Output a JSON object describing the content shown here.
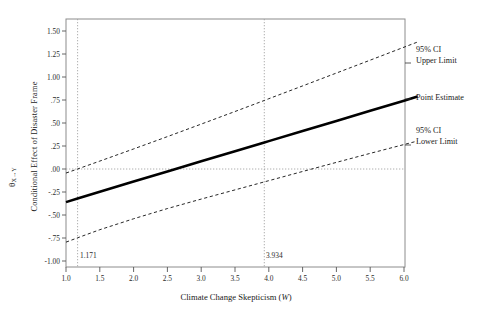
{
  "chart_data": {
    "type": "line",
    "title": "",
    "xlabel": "Climate Change Skepticism (W)",
    "ylabel_symbol": "θ",
    "ylabel_subscript": "X→Y",
    "ylabel_text": "Conditional Effect of Disaster Frame",
    "xlim": [
      1.0,
      6.2
    ],
    "ylim": [
      -1.09,
      1.64
    ],
    "grid": false,
    "legend_position": "right-outside",
    "xticks": [
      1.0,
      1.5,
      2.0,
      2.5,
      3.0,
      3.5,
      4.0,
      4.5,
      5.0,
      5.5,
      6.0
    ],
    "xtick_labels": [
      "1.0",
      "1.5",
      "2.0",
      "2.5",
      "3.0",
      "3.5",
      "4.0",
      "4.5",
      "5.0",
      "5.5",
      "6.0"
    ],
    "yticks": [
      1.5,
      1.25,
      1.0,
      0.75,
      0.5,
      0.25,
      0.0,
      -0.25,
      -0.5,
      -0.75,
      -1.0
    ],
    "ytick_labels": [
      "1.50",
      "1.25",
      "1.00",
      ".75",
      ".50",
      ".25",
      ".00",
      "-.25",
      "-.50",
      "-.75",
      "-1.00"
    ],
    "reference_lines": {
      "horizontal": {
        "value": 0.0,
        "style": "dotted"
      },
      "vertical": [
        {
          "value": 1.171,
          "label": "1.171",
          "style": "dotted"
        },
        {
          "value": 3.934,
          "label": "3.934",
          "style": "dotted"
        }
      ]
    },
    "x": [
      1.0,
      1.171,
      1.5,
      2.0,
      2.5,
      3.0,
      3.5,
      3.934,
      4.0,
      4.5,
      5.0,
      5.5,
      6.0,
      6.2
    ],
    "series": [
      {
        "name": "Point Estimate",
        "style": "solid",
        "width": "thick",
        "color": "#000000",
        "values": [
          -0.36,
          -0.321,
          -0.247,
          -0.137,
          -0.027,
          0.083,
          0.193,
          0.288,
          0.303,
          0.413,
          0.523,
          0.633,
          0.743,
          0.787
        ]
      },
      {
        "name": "95% CI Upper Limit",
        "style": "dashed",
        "width": "thin",
        "color": "#000000",
        "values": [
          -0.044,
          0.0,
          0.086,
          0.218,
          0.352,
          0.488,
          0.625,
          0.745,
          0.764,
          0.903,
          1.043,
          1.183,
          1.324,
          1.38
        ]
      },
      {
        "name": "95% CI Lower Limit",
        "style": "dashed",
        "width": "thin",
        "color": "#000000",
        "values": [
          -0.795,
          -0.748,
          -0.66,
          -0.541,
          -0.43,
          -0.327,
          -0.227,
          -0.14,
          -0.127,
          -0.027,
          0.072,
          0.17,
          0.266,
          0.304
        ]
      }
    ],
    "annotations": [
      {
        "name": "95% CI Upper Limit",
        "line1": "95% CI",
        "line2": "Upper Limit"
      },
      {
        "name": "Point Estimate",
        "line1": "Point Estimate",
        "line2": ""
      },
      {
        "name": "95% CI Lower Limit",
        "line1": "95% CI",
        "line2": "Lower Limit"
      }
    ]
  },
  "axes": {
    "x_label": "Climate Change Skepticism (",
    "x_label_italic": "W",
    "x_label_tail": ")",
    "y_label_text": "Conditional Effect of Disaster Frame",
    "y_label_theta": "θ",
    "y_label_theta_sub": "X→Y"
  },
  "annotations": {
    "upper_l1": "95% CI",
    "upper_l2": "Upper Limit",
    "point": "Point Estimate",
    "lower_l1": "95% CI",
    "lower_l2": "Lower Limit",
    "vline_low": "1.171",
    "vline_high": "3.934"
  }
}
